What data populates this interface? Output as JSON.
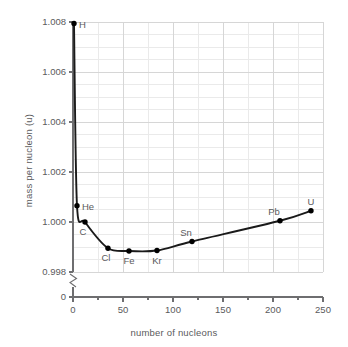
{
  "chart_data": {
    "type": "line",
    "title": "",
    "xlabel": "number of nucleons",
    "ylabel": "mass per nucleon (u)",
    "xlim": [
      0,
      250
    ],
    "ylim": [
      0.998,
      1.008
    ],
    "y_axis_break": true,
    "y_break_label": "0",
    "grid": true,
    "grid_major_x_step": 50,
    "grid_minor_x_step": 25,
    "grid_major_y_step": 0.002,
    "grid_minor_y_step": 0.0005,
    "xticks": [
      0,
      50,
      100,
      150,
      200,
      250
    ],
    "xtick_labels": [
      "0",
      "50",
      "100",
      "150",
      "200",
      "250"
    ],
    "yticks": [
      0.998,
      1.0,
      1.002,
      1.004,
      1.006,
      1.008
    ],
    "ytick_labels": [
      "0.998",
      "1.000",
      "1.002",
      "1.004",
      "1.006",
      "1.008"
    ],
    "legend": "none",
    "series": [
      {
        "name": "mass per nucleon",
        "points": [
          {
            "label": "H",
            "x": 1,
            "y": 1.00794,
            "label_pos": "right"
          },
          {
            "label": "He",
            "x": 4,
            "y": 1.00065,
            "label_pos": "right"
          },
          {
            "label": "C",
            "x": 12,
            "y": 1.0,
            "label_pos": "below-left"
          },
          {
            "label": "Cl",
            "x": 35,
            "y": 0.99895,
            "label_pos": "below-left"
          },
          {
            "label": "Fe",
            "x": 56,
            "y": 0.99884,
            "label_pos": "below"
          },
          {
            "label": "Kr",
            "x": 84,
            "y": 0.99886,
            "label_pos": "below"
          },
          {
            "label": "Sn",
            "x": 119,
            "y": 0.99922,
            "label_pos": "above-left"
          },
          {
            "label": "Pb",
            "x": 207,
            "y": 1.00005,
            "label_pos": "above-left"
          },
          {
            "label": "U",
            "x": 238,
            "y": 1.00045,
            "label_pos": "above"
          }
        ]
      }
    ],
    "colors": {
      "curve": "#1a1a1a",
      "marker": "#000000",
      "grid_major": "#d6d6d6",
      "grid_minor": "#eaeaea",
      "axis": "#6e6e70",
      "text": "#5a5a5c"
    }
  }
}
